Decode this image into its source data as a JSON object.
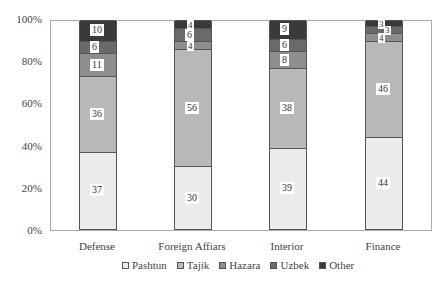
{
  "chart_data": {
    "type": "bar",
    "stacked": true,
    "title": "",
    "xlabel": "",
    "ylabel": "",
    "ylim": [
      0,
      100
    ],
    "yticks": [
      "0%",
      "20%",
      "40%",
      "60%",
      "80%",
      "100%"
    ],
    "categories": [
      "Defense",
      "Foreign Affiars",
      "Interior",
      "Finance"
    ],
    "series": [
      {
        "name": "Pashtun",
        "color": "#ebebeb",
        "values": [
          37,
          30,
          39,
          44
        ]
      },
      {
        "name": "Tajik",
        "color": "#b8b8b8",
        "values": [
          36,
          56,
          38,
          46
        ]
      },
      {
        "name": "Hazara",
        "color": "#8e8e8e",
        "values": [
          11,
          4,
          8,
          4
        ]
      },
      {
        "name": "Uzbek",
        "color": "#6a6a6a",
        "values": [
          6,
          6,
          6,
          3
        ]
      },
      {
        "name": "Other",
        "color": "#3a3a3a",
        "values": [
          10,
          4,
          9,
          3
        ]
      }
    ],
    "legend_position": "bottom",
    "grid": false
  },
  "legend": [
    "Pashtun",
    "Tajik",
    "Hazara",
    "Uzbek",
    "Other"
  ]
}
